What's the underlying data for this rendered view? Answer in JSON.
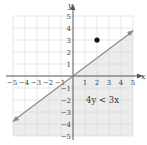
{
  "graph": {
    "x_axis_label": "x",
    "y_axis_label": "y",
    "x_ticks": [
      "−5",
      "−4",
      "−3",
      "−2",
      "−1",
      "1",
      "2",
      "3",
      "4",
      "5"
    ],
    "y_ticks": [
      "5",
      "4",
      "3",
      "2",
      "1",
      "−1",
      "−2",
      "−3",
      "−4",
      "−5"
    ],
    "inequality_label": "4y < 3x",
    "boundary_line": "4y = 3x",
    "test_point": {
      "x": 2,
      "y": 3
    },
    "shaded_region": "below line",
    "colors": {
      "shade": "#ececec",
      "grid": "#d6d6d6",
      "axis": "#555555",
      "line": "#8a8a8a",
      "point": "#111111"
    }
  }
}
